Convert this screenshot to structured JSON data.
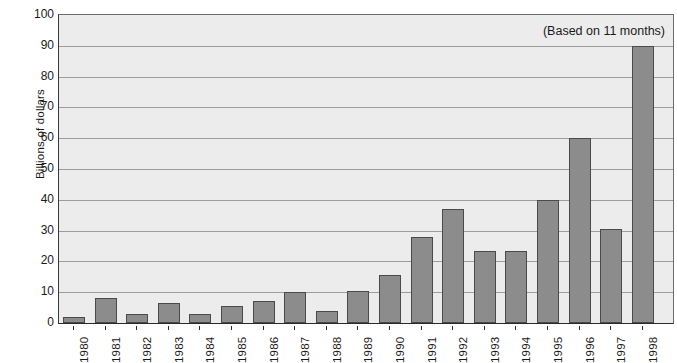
{
  "chart_data": {
    "type": "bar",
    "title": "",
    "xlabel": "",
    "ylabel": "Billions of dollars",
    "annotation": "(Based on 11 months)",
    "ylim": [
      0,
      100
    ],
    "ytick_step": 10,
    "yticks": [
      0,
      10,
      20,
      30,
      40,
      50,
      60,
      70,
      80,
      90,
      100
    ],
    "ytick_labels": [
      "0",
      "10",
      "20",
      "30",
      "40",
      "50",
      "60",
      "70",
      "80",
      "90",
      "100"
    ],
    "grid": true,
    "legend": false,
    "bar_color": "#8c8c8c",
    "bar_edge_color": "#4a4a4a",
    "plot_background": "#ececec",
    "gridline_color": "#9d9d9d",
    "categories": [
      "1980",
      "1981",
      "1982",
      "1983",
      "1984",
      "1985",
      "1986",
      "1987",
      "1988",
      "1989",
      "1990",
      "1991",
      "1992",
      "1993",
      "1994",
      "1995",
      "1996",
      "1997",
      "1998"
    ],
    "values": [
      2,
      8,
      2.8,
      6.5,
      3,
      5.5,
      7.3,
      10,
      4,
      10.3,
      15.5,
      28,
      37,
      23.5,
      23.5,
      40,
      60,
      30.5,
      90
    ]
  }
}
